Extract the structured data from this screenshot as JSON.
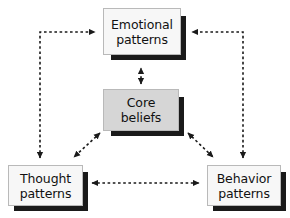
{
  "diagram": {
    "type": "cyclical-relationship-diagram",
    "background_color": "#ffffff",
    "shadow_color": "#1a1a1a",
    "arrow_color": "#1a1a1a",
    "arrow_style": "dashed",
    "nodes": [
      {
        "id": "emotional",
        "line1": "Emotional",
        "line2": "patterns",
        "fill_color": "#f7f7f7",
        "border_color": "#b9b9b9",
        "text_color": "#111111"
      },
      {
        "id": "core",
        "line1": "Core",
        "line2": "beliefs",
        "fill_color": "#d6d6d6",
        "border_color": "#b9b9b9",
        "text_color": "#111111"
      },
      {
        "id": "thought",
        "line1": "Thought",
        "line2": "patterns",
        "fill_color": "#f7f7f7",
        "border_color": "#b9b9b9",
        "text_color": "#111111"
      },
      {
        "id": "behavior",
        "line1": "Behavior",
        "line2": "patterns",
        "fill_color": "#f7f7f7",
        "border_color": "#b9b9b9",
        "text_color": "#111111"
      }
    ],
    "connections": [
      {
        "id": "core-emotional",
        "from": "core",
        "to": "emotional",
        "bidirectional": true,
        "path": "vertical"
      },
      {
        "id": "core-thought",
        "from": "core",
        "to": "thought",
        "bidirectional": true,
        "path": "diagonal"
      },
      {
        "id": "core-behavior",
        "from": "core",
        "to": "behavior",
        "bidirectional": true,
        "path": "diagonal"
      },
      {
        "id": "thought-behavior",
        "from": "thought",
        "to": "behavior",
        "bidirectional": true,
        "path": "horizontal"
      },
      {
        "id": "thought-emotional",
        "from": "thought",
        "to": "emotional",
        "bidirectional": true,
        "path": "elbow-left"
      },
      {
        "id": "behavior-emotional",
        "from": "behavior",
        "to": "emotional",
        "bidirectional": true,
        "path": "elbow-right"
      }
    ]
  }
}
